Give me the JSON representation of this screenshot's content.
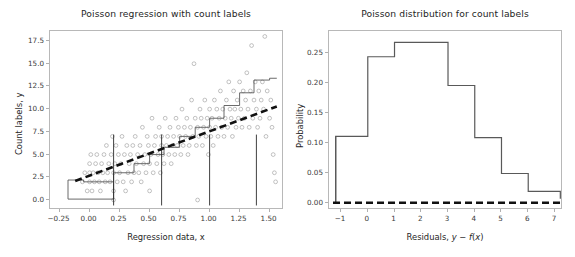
{
  "figure": {
    "width": 575,
    "height": 257,
    "background": "#ffffff",
    "n_panels": 2
  },
  "style": {
    "scatter_color": "#8c8c8c",
    "step_color": "#595959",
    "dashed_color": "#111111",
    "frame_color": "#b8b8b8",
    "text_color": "#262626",
    "tick_color": "#3a3a3a"
  },
  "left_panel": {
    "title": "Poisson regression with count labels",
    "xlabel": "Regression data, x",
    "ylabel": "Count labels, y",
    "xticks": [
      "-0.25",
      "0.00",
      "0.25",
      "0.50",
      "0.75",
      "1.00",
      "1.25",
      "1.50"
    ],
    "yticks": [
      "0.0",
      "2.5",
      "5.0",
      "7.5",
      "10.0",
      "12.5",
      "15.0",
      "17.5"
    ],
    "xlim": [
      -0.33,
      1.62
    ],
    "ylim": [
      -1.1,
      18.6
    ]
  },
  "right_panel": {
    "title": "Poisson distribution for count labels",
    "xlabel_parts": {
      "pre": "Residuals, ",
      "y": "y",
      "minus": " − ",
      "f": "f",
      "open": "(",
      "x": "x",
      "close": ")"
    },
    "xlabel_plain": "Residuals, y − f(x)",
    "ylabel": "Probability",
    "xticks": [
      "-1",
      "0",
      "1",
      "2",
      "3",
      "4",
      "5",
      "6",
      "7"
    ],
    "yticks": [
      "0.00",
      "0.05",
      "0.10",
      "0.15",
      "0.20",
      "0.25"
    ],
    "xlim": [
      -1.45,
      7.3
    ],
    "ylim": [
      -0.012,
      0.287
    ]
  },
  "chart_data": [
    {
      "type": "scatter",
      "panel": "left",
      "title": "Poisson regression with count labels",
      "xlabel": "Regression data, x",
      "ylabel": "Count labels, y",
      "xlim": [
        -0.33,
        1.62
      ],
      "ylim": [
        -1.1,
        18.6
      ],
      "xticks": [
        -0.25,
        0.0,
        0.25,
        0.5,
        0.75,
        1.0,
        1.25,
        1.5
      ],
      "yticks": [
        0.0,
        2.5,
        5.0,
        7.5,
        10.0,
        12.5,
        15.0,
        17.5
      ],
      "grid": false,
      "legend": false,
      "series": [
        {
          "name": "count observations",
          "type": "scatter",
          "marker": "open-circle",
          "color": "#8c8c8c",
          "points": [
            [
              -0.06,
              2
            ],
            [
              -0.04,
              3
            ],
            [
              -0.02,
              1
            ],
            [
              0.0,
              4
            ],
            [
              0.0,
              2
            ],
            [
              0.0,
              3
            ],
            [
              0.01,
              5
            ],
            [
              0.02,
              1
            ],
            [
              0.03,
              3
            ],
            [
              0.04,
              2
            ],
            [
              0.05,
              4
            ],
            [
              0.06,
              5
            ],
            [
              0.07,
              3
            ],
            [
              0.08,
              2
            ],
            [
              0.09,
              1
            ],
            [
              0.1,
              4
            ],
            [
              0.11,
              3
            ],
            [
              0.12,
              5
            ],
            [
              0.13,
              2
            ],
            [
              0.14,
              6
            ],
            [
              0.15,
              3
            ],
            [
              0.16,
              4
            ],
            [
              0.17,
              2
            ],
            [
              0.18,
              5
            ],
            [
              0.19,
              7
            ],
            [
              0.2,
              3
            ],
            [
              0.2,
              1
            ],
            [
              0.2,
              0
            ],
            [
              0.21,
              4
            ],
            [
              0.22,
              6
            ],
            [
              0.23,
              2
            ],
            [
              0.24,
              5
            ],
            [
              0.25,
              3
            ],
            [
              0.26,
              4
            ],
            [
              0.27,
              7
            ],
            [
              0.28,
              2
            ],
            [
              0.29,
              5
            ],
            [
              0.3,
              1
            ],
            [
              0.31,
              6
            ],
            [
              0.32,
              3
            ],
            [
              0.33,
              4
            ],
            [
              0.34,
              5
            ],
            [
              0.35,
              2
            ],
            [
              0.36,
              6
            ],
            [
              0.37,
              3
            ],
            [
              0.38,
              7
            ],
            [
              0.39,
              4
            ],
            [
              0.4,
              5
            ],
            [
              0.41,
              3
            ],
            [
              0.42,
              6
            ],
            [
              0.43,
              2
            ],
            [
              0.44,
              8
            ],
            [
              0.45,
              4
            ],
            [
              0.46,
              5
            ],
            [
              0.47,
              3
            ],
            [
              0.48,
              7
            ],
            [
              0.49,
              6
            ],
            [
              0.5,
              4
            ],
            [
              0.5,
              1
            ],
            [
              0.51,
              5
            ],
            [
              0.52,
              9
            ],
            [
              0.53,
              3
            ],
            [
              0.54,
              6
            ],
            [
              0.55,
              7
            ],
            [
              0.56,
              4
            ],
            [
              0.57,
              5
            ],
            [
              0.58,
              8
            ],
            [
              0.59,
              3
            ],
            [
              0.6,
              6
            ],
            [
              0.6,
              7
            ],
            [
              0.61,
              5
            ],
            [
              0.62,
              4
            ],
            [
              0.63,
              9
            ],
            [
              0.64,
              6
            ],
            [
              0.65,
              7
            ],
            [
              0.66,
              5
            ],
            [
              0.67,
              8
            ],
            [
              0.68,
              4
            ],
            [
              0.69,
              6
            ],
            [
              0.7,
              7
            ],
            [
              0.71,
              5
            ],
            [
              0.72,
              9
            ],
            [
              0.73,
              6
            ],
            [
              0.74,
              8
            ],
            [
              0.75,
              7
            ],
            [
              0.76,
              5
            ],
            [
              0.77,
              10
            ],
            [
              0.78,
              6
            ],
            [
              0.79,
              8
            ],
            [
              0.8,
              7
            ],
            [
              0.81,
              9
            ],
            [
              0.82,
              5
            ],
            [
              0.83,
              6
            ],
            [
              0.84,
              8
            ],
            [
              0.85,
              11
            ],
            [
              0.86,
              7
            ],
            [
              0.87,
              15
            ],
            [
              0.88,
              9
            ],
            [
              0.89,
              6
            ],
            [
              0.9,
              8
            ],
            [
              0.9,
              0
            ],
            [
              0.91,
              7
            ],
            [
              0.92,
              10
            ],
            [
              0.93,
              9
            ],
            [
              0.94,
              6
            ],
            [
              0.95,
              8
            ],
            [
              0.96,
              11
            ],
            [
              0.97,
              7
            ],
            [
              0.98,
              9
            ],
            [
              0.99,
              5
            ],
            [
              1.0,
              8
            ],
            [
              1.0,
              10
            ],
            [
              1.01,
              7
            ],
            [
              1.02,
              9
            ],
            [
              1.03,
              6
            ],
            [
              1.04,
              11
            ],
            [
              1.05,
              8
            ],
            [
              1.06,
              10
            ],
            [
              1.07,
              7
            ],
            [
              1.08,
              9
            ],
            [
              1.09,
              12
            ],
            [
              1.1,
              8
            ],
            [
              1.11,
              10
            ],
            [
              1.12,
              7
            ],
            [
              1.13,
              9
            ],
            [
              1.14,
              11
            ],
            [
              1.15,
              8
            ],
            [
              1.16,
              13
            ],
            [
              1.17,
              10
            ],
            [
              1.18,
              9
            ],
            [
              1.19,
              7
            ],
            [
              1.2,
              12
            ],
            [
              1.21,
              10
            ],
            [
              1.22,
              8
            ],
            [
              1.23,
              11
            ],
            [
              1.24,
              9
            ],
            [
              1.25,
              13
            ],
            [
              1.26,
              10
            ],
            [
              1.27,
              8
            ],
            [
              1.28,
              12
            ],
            [
              1.29,
              9
            ],
            [
              1.3,
              11
            ],
            [
              1.31,
              14
            ],
            [
              1.32,
              10
            ],
            [
              1.33,
              8
            ],
            [
              1.34,
              12
            ],
            [
              1.35,
              17
            ],
            [
              1.36,
              9
            ],
            [
              1.37,
              11
            ],
            [
              1.38,
              13
            ],
            [
              1.39,
              10
            ],
            [
              1.4,
              8
            ],
            [
              1.41,
              12
            ],
            [
              1.42,
              9
            ],
            [
              1.43,
              11
            ],
            [
              1.44,
              13
            ],
            [
              1.45,
              10
            ],
            [
              1.46,
              18
            ],
            [
              1.47,
              7
            ],
            [
              1.48,
              12
            ],
            [
              1.5,
              9
            ],
            [
              1.51,
              11
            ],
            [
              1.52,
              8
            ],
            [
              1.53,
              5
            ],
            [
              1.54,
              3
            ],
            [
              1.55,
              2
            ]
          ]
        },
        {
          "name": "step fit",
          "type": "step",
          "color": "#595959",
          "x": [
            -0.18,
            -0.05,
            0.2,
            0.37,
            0.5,
            0.62,
            0.75,
            0.88,
            1.0,
            1.12,
            1.25,
            1.37,
            1.5
          ],
          "y": [
            2.2,
            2.0,
            3.0,
            4.0,
            5.0,
            5.8,
            7.0,
            8.0,
            9.0,
            10.4,
            11.8,
            13.2,
            13.4
          ]
        },
        {
          "name": "regression trend (dashed)",
          "type": "line",
          "style": "dashed",
          "color": "#111111",
          "x": [
            -0.12,
            1.56
          ],
          "y": [
            2.1,
            10.3
          ]
        }
      ]
    },
    {
      "type": "histogram",
      "panel": "right",
      "title": "Poisson distribution for count labels",
      "xlabel": "Residuals, y − f(x)",
      "ylabel": "Probability",
      "xlim": [
        -1.45,
        7.3
      ],
      "ylim": [
        -0.012,
        0.287
      ],
      "xticks": [
        -1,
        0,
        1,
        2,
        3,
        4,
        5,
        6,
        7
      ],
      "yticks": [
        0.0,
        0.05,
        0.1,
        0.15,
        0.2,
        0.25
      ],
      "grid": false,
      "legend": false,
      "bin_edges": [
        -1.3,
        -1.2,
        0,
        1,
        2,
        3,
        4,
        5,
        6,
        7.2
      ],
      "bin_values": [
        0.0,
        0.111,
        0.244,
        0.268,
        0.268,
        0.196,
        0.109,
        0.049,
        0.019,
        0.007
      ],
      "series": [
        {
          "name": "Poisson probability",
          "type": "step",
          "color": "#595959",
          "categories": [
            -1,
            0,
            1,
            2,
            3,
            4,
            5,
            6,
            7
          ],
          "values": [
            0.111,
            0.244,
            0.268,
            0.268,
            0.196,
            0.109,
            0.049,
            0.019,
            0.007
          ]
        },
        {
          "name": "zero baseline (dashed)",
          "type": "line",
          "style": "dashed",
          "color": "#111111",
          "x": [
            -1.3,
            7.2
          ],
          "y": [
            0.0,
            0.0
          ]
        }
      ]
    }
  ]
}
